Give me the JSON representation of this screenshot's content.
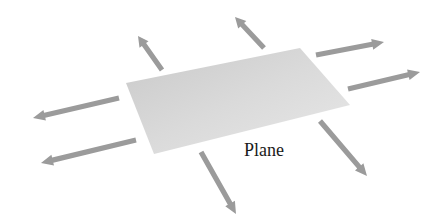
{
  "diagram": {
    "label": "Plane",
    "colors": {
      "arrow": "#9b9b9b",
      "plane_light": "#e6e6e6",
      "plane_dark": "#c4c4c4",
      "text": "#1a1a1a",
      "background": "#ffffff"
    },
    "plane": {
      "corners": [
        [
          126,
          83
        ],
        [
          300,
          48
        ],
        [
          350,
          105
        ],
        [
          154,
          154
        ]
      ]
    },
    "arrows": [
      {
        "id": "left-upper",
        "from": [
          119,
          98
        ],
        "to": [
          33,
          118
        ]
      },
      {
        "id": "left-lower",
        "from": [
          136,
          140
        ],
        "to": [
          41,
          163
        ]
      },
      {
        "id": "up-left",
        "from": [
          162,
          70
        ],
        "to": [
          138,
          36
        ]
      },
      {
        "id": "up-right",
        "from": [
          264,
          48
        ],
        "to": [
          235,
          17
        ]
      },
      {
        "id": "right-upper",
        "from": [
          316,
          55
        ],
        "to": [
          384,
          42
        ]
      },
      {
        "id": "right-lower",
        "from": [
          348,
          89
        ],
        "to": [
          420,
          72
        ]
      },
      {
        "id": "down-right",
        "from": [
          320,
          121
        ],
        "to": [
          367,
          176
        ]
      },
      {
        "id": "down-center",
        "from": [
          201,
          152
        ],
        "to": [
          236,
          214
        ]
      }
    ]
  }
}
